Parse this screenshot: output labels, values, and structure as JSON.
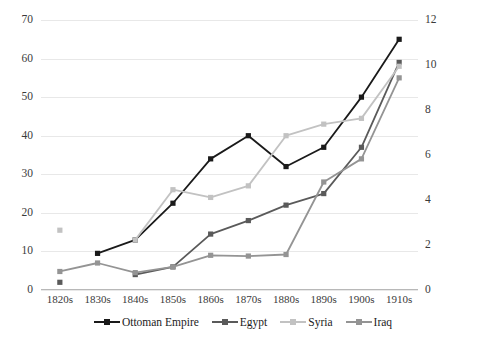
{
  "chart_data": {
    "type": "line",
    "title": "",
    "xlabel": "",
    "ylabel": "",
    "categories": [
      "1820s",
      "1830s",
      "1840s",
      "1850s",
      "1860s",
      "1870s",
      "1880s",
      "1890s",
      "1900s",
      "1910s"
    ],
    "left_axis": {
      "ticks": [
        0,
        10,
        20,
        30,
        40,
        50,
        60,
        70
      ],
      "ylim": [
        0,
        70
      ],
      "tick_labels": [
        "0",
        "10",
        "20",
        "30",
        "40",
        "50",
        "60",
        "70"
      ]
    },
    "right_axis": {
      "ticks": [
        0,
        2,
        4,
        6,
        8,
        10,
        12
      ],
      "ylim": [
        0,
        12
      ],
      "tick_labels": [
        "0",
        "2",
        "4",
        "6",
        "8",
        "10",
        "12"
      ]
    },
    "grid": true,
    "legend_position": "bottom",
    "series": [
      {
        "name": "Ottoman Empire",
        "color": "#1a1a1a",
        "axis": "left",
        "values": [
          null,
          9.5,
          13.0,
          22.5,
          34.0,
          40.0,
          32.0,
          37.0,
          50.0,
          65.0
        ]
      },
      {
        "name": "Egypt",
        "color": "#5a5a5a",
        "axis": "left",
        "values": [
          2.0,
          null,
          4.0,
          6.0,
          14.5,
          18.0,
          22.0,
          25.0,
          37.0,
          59.0
        ]
      },
      {
        "name": "Syria",
        "color": "#c2c2c2",
        "axis": "left",
        "values": [
          15.5,
          null,
          13.0,
          26.0,
          24.0,
          27.0,
          40.0,
          43.0,
          44.5,
          58.0
        ]
      },
      {
        "name": "Iraq",
        "color": "#949494",
        "axis": "left",
        "values": [
          4.8,
          7.0,
          4.5,
          6.0,
          9.0,
          8.8,
          9.2,
          28.0,
          34.0,
          55.0
        ]
      }
    ]
  },
  "legend": {
    "entries": [
      {
        "label": "Ottoman Empire"
      },
      {
        "label": "Egypt"
      },
      {
        "label": "Syria"
      },
      {
        "label": "Iraq"
      }
    ]
  }
}
